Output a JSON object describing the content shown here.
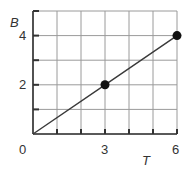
{
  "chart_data": {
    "type": "line",
    "title": "",
    "xlabel": "T",
    "ylabel": "B",
    "xlim": [
      0,
      6
    ],
    "ylim": [
      0,
      5
    ],
    "grid": true,
    "grid_x_step": 1,
    "grid_y_step": 1,
    "x_tick_labels": [
      "0",
      "3",
      "6"
    ],
    "y_tick_labels": [
      "2",
      "4"
    ],
    "series": [
      {
        "name": "B vs T",
        "x": [
          0,
          3,
          6
        ],
        "y": [
          0,
          2,
          4
        ],
        "markers_at": [
          [
            3,
            2
          ],
          [
            6,
            4
          ]
        ]
      }
    ]
  },
  "labels": {
    "origin": "0",
    "x_tick_3": "3",
    "x_tick_6": "6",
    "y_tick_2": "2",
    "y_tick_4": "4",
    "x_axis": "T",
    "y_axis": "B"
  },
  "colors": {
    "grid": "#9a9a9a",
    "axis": "#333333",
    "line": "#3a3a3a",
    "marker": "#111111"
  }
}
